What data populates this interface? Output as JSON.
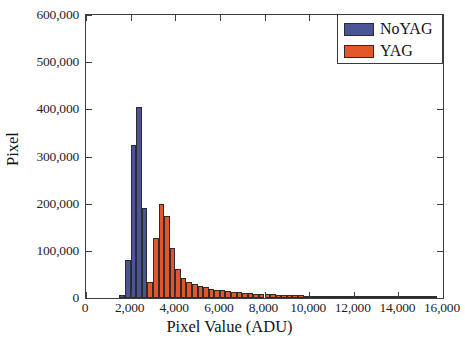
{
  "chart_data": {
    "type": "bar",
    "subtype": "histogram",
    "title": "",
    "xlabel": "Pixel Value (ADU)",
    "ylabel": "Pixel",
    "xlim": [
      0,
      16000
    ],
    "ylim": [
      0,
      600000
    ],
    "xticks": [
      0,
      2000,
      4000,
      6000,
      8000,
      10000,
      12000,
      14000,
      16000
    ],
    "xtick_labels": [
      "0",
      "2,000",
      "4,000",
      "6,000",
      "8,000",
      "10,000",
      "12,000",
      "14,000",
      "16,000"
    ],
    "yticks": [
      0,
      100000,
      200000,
      300000,
      400000,
      500000,
      600000
    ],
    "ytick_labels": [
      "0",
      "100,000",
      "200,000",
      "300,000",
      "400,000",
      "500,000",
      "600,000"
    ],
    "grid": false,
    "legend_position": "top-right",
    "bin_width": 250,
    "colors": {
      "noyag": "#4a5496",
      "yag": "#e1562a",
      "edge": "#2c2c2c",
      "axis": "#3d3d3d",
      "background": "#ffffff"
    },
    "series": [
      {
        "name": "NoYAG",
        "color": "#4a5496",
        "bins": [
          1500,
          1750,
          2000,
          2250,
          2500,
          2750,
          3000,
          3250
        ],
        "values": [
          6000,
          80000,
          325000,
          405000,
          190000,
          9000,
          3000,
          1500
        ]
      },
      {
        "name": "YAG",
        "color": "#e1562a",
        "bins": [
          2750,
          3000,
          3250,
          3500,
          3750,
          4000,
          4250,
          4500,
          4750,
          5000,
          5250,
          5500,
          5750,
          6000,
          6250,
          6500,
          6750,
          7000,
          7250,
          7500,
          7750,
          8000,
          8250,
          8500,
          8750,
          9000,
          9250,
          9500,
          9750,
          10000,
          10250,
          10500,
          10750,
          11000,
          11500,
          12000,
          12500,
          13000,
          13500,
          14000,
          14500,
          15000,
          15500
        ],
        "values": [
          35000,
          128000,
          200000,
          173000,
          105000,
          62000,
          43000,
          34000,
          30000,
          26000,
          23000,
          20000,
          18000,
          16000,
          14500,
          13000,
          12000,
          11000,
          10000,
          9200,
          8500,
          8000,
          7500,
          7000,
          6600,
          6200,
          5800,
          5400,
          5000,
          4700,
          4400,
          4100,
          3800,
          3500,
          3100,
          2700,
          2300,
          2000,
          1700,
          1400,
          1100,
          900,
          700
        ]
      }
    ]
  },
  "legend": {
    "entries": [
      {
        "label": "NoYAG",
        "swatch": "noyag"
      },
      {
        "label": "YAG",
        "swatch": "yag"
      }
    ]
  }
}
